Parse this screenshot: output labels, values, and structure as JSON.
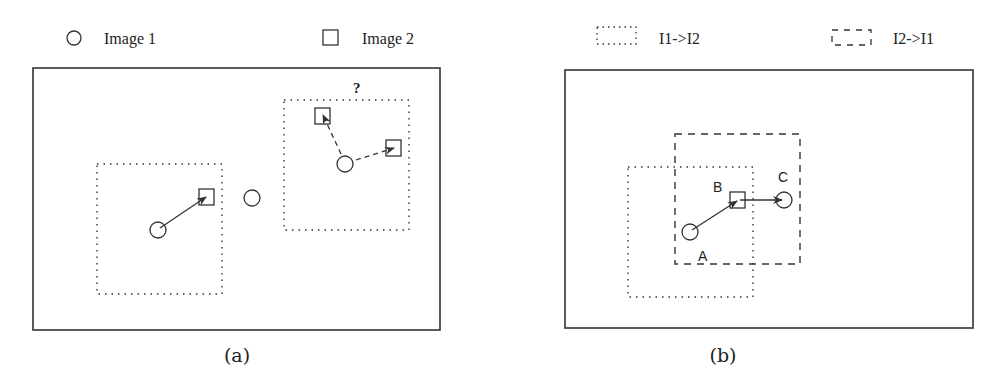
{
  "legend": {
    "image1": {
      "label": "Image 1",
      "icon": "circle-icon"
    },
    "image2": {
      "label": "Image 2",
      "icon": "square-icon"
    },
    "i1_to_i2": {
      "label": "I1->I2",
      "icon": "dotted-box-icon"
    },
    "i2_to_i1": {
      "label": "I2->I1",
      "icon": "dashed-box-icon"
    }
  },
  "panel_a": {
    "caption": "(a)",
    "question_mark": "?",
    "frame": {
      "x": 33,
      "y": 68,
      "w": 407,
      "h": 262
    }
  },
  "panel_b": {
    "caption": "(b)",
    "frame": {
      "x": 565,
      "y": 70,
      "w": 408,
      "h": 258
    },
    "labels": {
      "A": "A",
      "B": "B",
      "C": "C"
    }
  },
  "colors": {
    "stroke": "#333333",
    "background": "#ffffff"
  }
}
